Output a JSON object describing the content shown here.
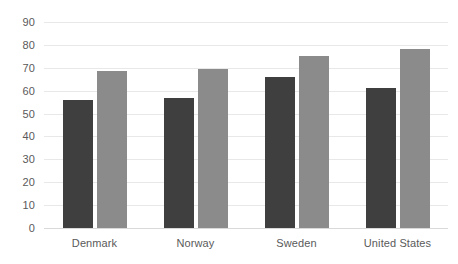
{
  "chart_data": {
    "type": "bar",
    "title": "",
    "subtitle": "",
    "xlabel": "",
    "ylabel": "",
    "categories": [
      "Denmark",
      "Norway",
      "Sweden",
      "United States"
    ],
    "series": [
      {
        "name": "Series 1",
        "color": "#3f3f3f",
        "values": [
          56,
          57,
          66,
          61
        ]
      },
      {
        "name": "Series 2",
        "color": "#8b8b8b",
        "values": [
          68.5,
          69.5,
          75,
          78
        ]
      }
    ],
    "ylim": [
      0,
      90
    ],
    "ytick_labels": [
      "0",
      "10",
      "20",
      "30",
      "40",
      "50",
      "60",
      "70",
      "80",
      "90"
    ],
    "ytick_values": [
      0,
      10,
      20,
      30,
      40,
      50,
      60,
      70,
      80,
      90
    ],
    "grid": true,
    "grid_axis": "y",
    "legend": false,
    "legend_position": "none",
    "annotations": [],
    "background_color": "#ffffff",
    "gridline_color": "#e8e8e8",
    "tick_label_color": "#5a5a5a"
  }
}
